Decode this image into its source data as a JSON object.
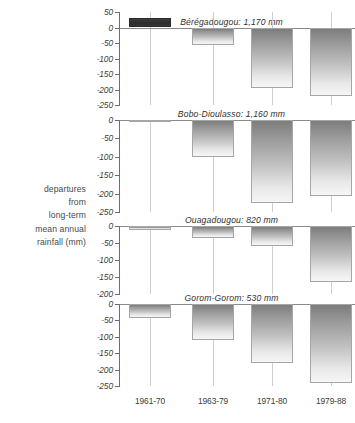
{
  "axis_caption": {
    "lines": [
      "departures",
      "from",
      "long-term",
      "mean annual",
      "rainfall (mm)"
    ]
  },
  "chart_data": {
    "type": "bar",
    "title": "",
    "subtitle": "",
    "xlabel": "",
    "ylabel": "departures from long-term mean annual rainfall (mm)",
    "grid": true,
    "legend": "none",
    "orientation": "vertical",
    "categories": [
      "1961-70",
      "1963-79",
      "1971-80",
      "1979-88"
    ],
    "panels": [
      {
        "name": "Beregadougou",
        "title": "Bérégadougou: 1,170 mm",
        "mean_annual_rainfall_mm": 1170,
        "ylim": [
          -250,
          50
        ],
        "yticks": [
          50,
          0,
          -50,
          -100,
          -150,
          -200,
          -250
        ],
        "ytick_labels": [
          "50",
          "0",
          "-50",
          "-100",
          "-150",
          "-200",
          "-250"
        ],
        "values": [
          30,
          -58,
          -195,
          -220
        ]
      },
      {
        "name": "Bobo-Dioulasso",
        "title": "Bobo-Dioulasso: 1,160 mm",
        "mean_annual_rainfall_mm": 1160,
        "ylim": [
          -250,
          0
        ],
        "yticks": [
          0,
          -50,
          -100,
          -150,
          -200,
          -250
        ],
        "ytick_labels": [
          "0",
          "-50",
          "-100",
          "-150",
          "-200",
          "-250"
        ],
        "values": [
          -3,
          -100,
          -225,
          -207
        ]
      },
      {
        "name": "Ouagadougou",
        "title": "Ouagadougou: 820 mm",
        "mean_annual_rainfall_mm": 820,
        "ylim": [
          -200,
          0
        ],
        "yticks": [
          0,
          -50,
          -100,
          -150,
          -200
        ],
        "ytick_labels": [
          "0",
          "-50",
          "-100",
          "-150",
          "-200"
        ],
        "values": [
          -12,
          -35,
          -58,
          -165
        ]
      },
      {
        "name": "Gorom-Gorom",
        "title": "Gorom-Gorom: 530 mm",
        "mean_annual_rainfall_mm": 530,
        "ylim": [
          -250,
          0
        ],
        "yticks": [
          0,
          -50,
          -100,
          -150,
          -200,
          -250
        ],
        "ytick_labels": [
          "0",
          "-50",
          "-100",
          "-150",
          "-200",
          "-250"
        ],
        "values": [
          -42,
          -110,
          -180,
          -240
        ]
      }
    ]
  }
}
